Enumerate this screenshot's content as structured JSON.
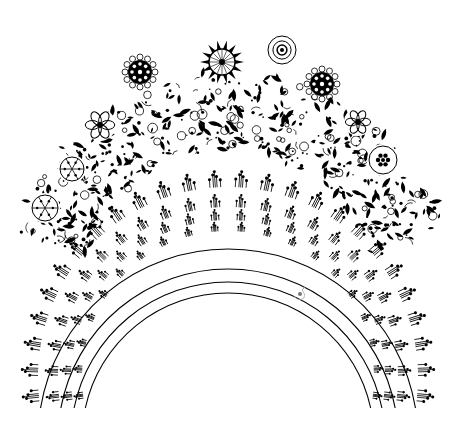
{
  "image": {
    "title": "Decorative folk-art arch illustration",
    "width": 461,
    "height": 424,
    "background": "#ffffff",
    "ink": "#000000"
  },
  "floral_wreath": {
    "description": "Dense black-and-white floral garland forming an upper arch",
    "center": [
      230,
      300
    ],
    "inner_radius": 150,
    "outer_radius": 225,
    "start_deg": 198,
    "end_deg": 342,
    "medallions": [
      {
        "type": "checker-flower",
        "x": 140,
        "y": 72,
        "r": 14
      },
      {
        "type": "sunburst-flower",
        "x": 222,
        "y": 62,
        "r": 16
      },
      {
        "type": "ringed-circle",
        "x": 282,
        "y": 50,
        "r": 14
      },
      {
        "type": "checker-flower",
        "x": 322,
        "y": 84,
        "r": 14
      },
      {
        "type": "petal-flower",
        "x": 358,
        "y": 122,
        "r": 12
      },
      {
        "type": "dot-flower",
        "x": 383,
        "y": 160,
        "r": 14
      },
      {
        "type": "petal-flower",
        "x": 100,
        "y": 125,
        "r": 14
      },
      {
        "type": "spoke-flower",
        "x": 72,
        "y": 169,
        "r": 12
      },
      {
        "type": "spoke-flower",
        "x": 45,
        "y": 208,
        "r": 13
      }
    ]
  },
  "beaded_arches": {
    "description": "Four concentric semicircular lines decorated with sprig/berry motifs",
    "center": [
      228,
      377
    ],
    "bottom_y": 408,
    "rings": [
      {
        "radius": 190,
        "sprig_size": 9,
        "sprig_count": 26
      },
      {
        "radius": 170,
        "sprig_size": 7,
        "sprig_count": 24
      },
      {
        "radius": 157,
        "sprig_size": 6,
        "sprig_count": 22
      },
      {
        "radius": 146,
        "sprig_size": 5,
        "sprig_count": 20
      }
    ]
  },
  "signature_mark": {
    "description": "Faint small sketch mark",
    "x": 300,
    "y": 294
  }
}
